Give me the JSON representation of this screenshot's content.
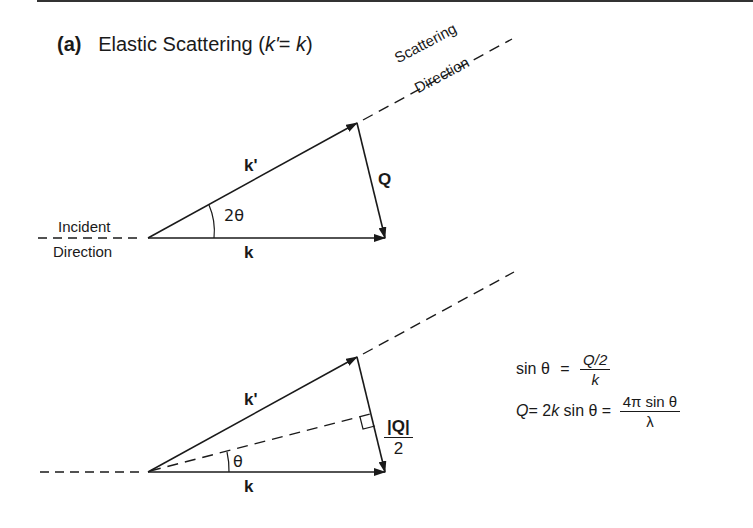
{
  "panel": {
    "label": "(a)",
    "title_text": "Elastic Scattering",
    "title_condition_open": "(",
    "title_condition_kprime": "k'",
    "title_condition_eq": "= ",
    "title_condition_k": "k",
    "title_condition_close": ")"
  },
  "top_diagram": {
    "incident_label_line1": "Incident",
    "incident_label_line2": "Direction",
    "scattering_label_line1": "Scattering",
    "scattering_label_line2": "Direction",
    "k_prime_label": "k'",
    "k_label": "k",
    "Q_label": "Q",
    "angle_label": "2θ"
  },
  "bottom_diagram": {
    "k_prime_label": "k'",
    "k_label": "k",
    "half_Q_numerator": "|Q|",
    "half_Q_denominator": "2",
    "angle_label": "θ"
  },
  "equations": {
    "eq1_lhs": "sin θ",
    "eq1_eq": "=",
    "eq1_num": "Q/2",
    "eq1_den": "k",
    "eq2_lhs_Q": "Q",
    "eq2_mid": "= 2",
    "eq2_k": "k",
    "eq2_sin": " sin θ =",
    "eq2_num": "4π sin θ",
    "eq2_den": "λ"
  },
  "colors": {
    "ink": "#1a1a1a",
    "background": "#ffffff"
  }
}
